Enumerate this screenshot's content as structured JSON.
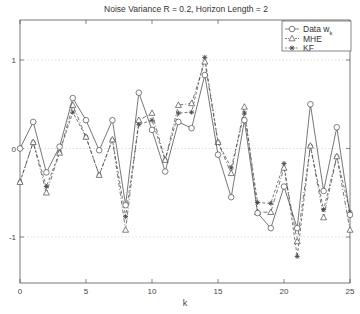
{
  "chart_data": {
    "type": "line",
    "title": "Noise Variance R = 0.2, Horizon Length = 2",
    "xlabel": "k",
    "ylabel": "",
    "xlim": [
      0,
      25
    ],
    "ylim": [
      -1.55,
      1.45
    ],
    "xticks": [
      0,
      5,
      10,
      15,
      20,
      25
    ],
    "yticks": [
      -1,
      0,
      1
    ],
    "ytick_labels": [
      "-1",
      "0",
      "1"
    ],
    "grid": "dotted horizontal at y ticks",
    "legend_position": "upper right",
    "x": [
      0,
      1,
      2,
      3,
      4,
      5,
      6,
      7,
      8,
      9,
      10,
      11,
      12,
      13,
      14,
      15,
      16,
      17,
      18,
      19,
      20,
      21,
      22,
      23,
      24,
      25
    ],
    "series": [
      {
        "name": "Data w_k",
        "legend_label": "Data w",
        "legend_sub": "k",
        "style": "solid",
        "marker": "circle",
        "values": [
          0.0,
          0.3,
          -0.27,
          0.02,
          0.57,
          0.32,
          -0.02,
          0.32,
          -0.64,
          0.63,
          0.21,
          -0.26,
          0.3,
          0.23,
          0.83,
          -0.07,
          -0.55,
          0.32,
          -0.73,
          -0.9,
          -0.43,
          -0.9,
          0.5,
          -0.48,
          0.24,
          -0.75
        ]
      },
      {
        "name": "MHE",
        "legend_label": "MHE",
        "style": "dashdot",
        "marker": "triangle",
        "values": [
          -0.38,
          0.07,
          -0.5,
          -0.05,
          0.49,
          0.13,
          -0.3,
          0.1,
          -0.92,
          0.32,
          0.4,
          -0.13,
          0.49,
          0.51,
          0.98,
          0.07,
          -0.28,
          0.47,
          -0.72,
          -0.72,
          -0.22,
          -1.05,
          0.03,
          -0.78,
          -0.09,
          -0.92
        ]
      },
      {
        "name": "KF",
        "legend_label": "KF",
        "style": "dashed",
        "marker": "asterisk",
        "values": [
          -0.38,
          0.07,
          -0.43,
          -0.04,
          0.41,
          0.13,
          -0.3,
          0.1,
          -0.77,
          0.27,
          0.32,
          -0.13,
          0.4,
          0.41,
          1.03,
          0.07,
          -0.22,
          0.4,
          -0.61,
          -0.62,
          -0.17,
          -1.22,
          0.03,
          -0.69,
          -0.09,
          -0.72
        ]
      }
    ]
  },
  "colors": {
    "line": "#4a4a4a",
    "axis": "#555555",
    "grid": "#c8c8c8",
    "background": "#ffffff"
  }
}
